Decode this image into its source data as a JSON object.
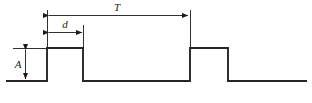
{
  "diagram": {
    "type": "pulse-train-timing-diagram",
    "background_color": "#ffffff",
    "line_color": "#1a1a1a",
    "signal_line_color": "#262626",
    "labels": {
      "period": "T",
      "pulse_width": "d",
      "amplitude": "A"
    },
    "geometry": {
      "baseline_y": 81,
      "pulse_top_y": 48,
      "baseline_start_x": 6,
      "baseline_end_x": 307,
      "pulse1_rise_x": 47,
      "pulse1_fall_x": 83,
      "pulse2_rise_x": 190,
      "pulse2_fall_x": 228,
      "period_arrow_y": 15,
      "width_arrow_y": 32,
      "amplitude_arrow_x": 25
    },
    "signal_path": "M 6 81 L 47 81 L 47 48 L 83 48 L 83 81 L 190 81 L 190 48 L 228 48 L 228 81 L 307 81"
  }
}
